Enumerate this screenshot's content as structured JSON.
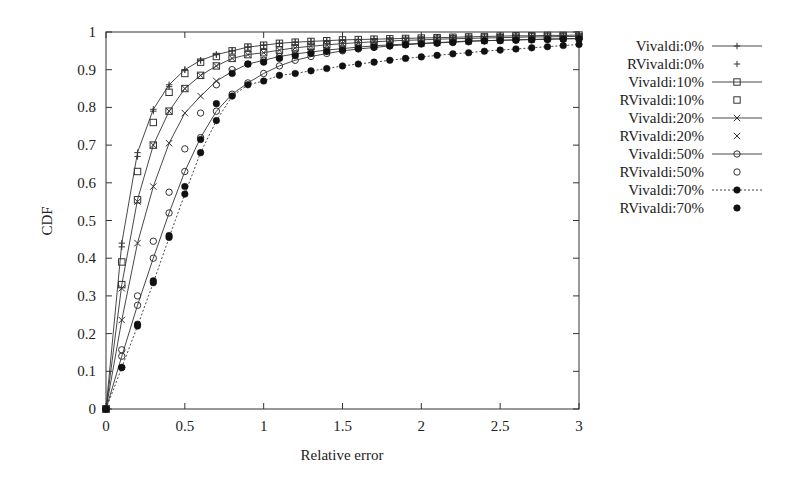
{
  "chart_data": {
    "type": "line",
    "title": "",
    "xlabel": "Relative error",
    "ylabel": "CDF",
    "xlim": [
      0,
      3
    ],
    "ylim": [
      0,
      1
    ],
    "xticks": [
      "0",
      "0.5",
      "1",
      "1.5",
      "2",
      "2.5",
      "3"
    ],
    "xtick_values": [
      0,
      0.5,
      1,
      1.5,
      2,
      2.5,
      3
    ],
    "yticks": [
      "0",
      "0.1",
      "0.2",
      "0.3",
      "0.4",
      "0.5",
      "0.6",
      "0.7",
      "0.8",
      "0.9",
      "1"
    ],
    "ytick_values": [
      0,
      0.1,
      0.2,
      0.3,
      0.4,
      0.5,
      0.6,
      0.7,
      0.8,
      0.9,
      1
    ],
    "grid": false,
    "legend_position": "outside-right",
    "x": [
      0,
      0.1,
      0.2,
      0.3,
      0.4,
      0.5,
      0.6,
      0.7,
      0.8,
      0.9,
      1.0,
      1.1,
      1.2,
      1.3,
      1.4,
      1.5,
      1.6,
      1.7,
      1.8,
      1.9,
      2.0,
      2.1,
      2.2,
      2.3,
      2.4,
      2.5,
      2.6,
      2.7,
      2.8,
      2.9,
      3.0
    ],
    "series": [
      {
        "name": "Vivaldi:0%",
        "marker": "plus",
        "line": "solid",
        "values": [
          0,
          0.44,
          0.68,
          0.795,
          0.86,
          0.9,
          0.925,
          0.94,
          0.95,
          0.96,
          0.965,
          0.97,
          0.973,
          0.975,
          0.977,
          0.979,
          0.98,
          0.981,
          0.982,
          0.983,
          0.984,
          0.985,
          0.986,
          0.987,
          0.988,
          0.989,
          0.99,
          0.99,
          0.991,
          0.991,
          0.992
        ]
      },
      {
        "name": "RVivaldi:0%",
        "marker": "plus",
        "line": "none",
        "values": [
          0,
          0.43,
          0.67,
          0.79,
          0.855,
          0.9,
          0.925,
          0.94,
          0.95,
          0.96,
          0.965,
          0.97,
          0.973,
          0.975,
          0.977,
          0.979,
          0.98,
          0.981,
          0.982,
          0.983,
          0.984,
          0.985,
          0.986,
          0.987,
          0.988,
          0.989,
          0.99,
          0.99,
          0.991,
          0.991,
          0.992
        ]
      },
      {
        "name": "Vivaldi:10%",
        "marker": "square",
        "line": "solid",
        "values": [
          0,
          0.33,
          0.555,
          0.7,
          0.79,
          0.85,
          0.885,
          0.91,
          0.93,
          0.94,
          0.945,
          0.952,
          0.958,
          0.962,
          0.966,
          0.969,
          0.972,
          0.974,
          0.976,
          0.978,
          0.979,
          0.981,
          0.982,
          0.983,
          0.984,
          0.985,
          0.986,
          0.987,
          0.987,
          0.988,
          0.988
        ]
      },
      {
        "name": "RVivaldi:10%",
        "marker": "square",
        "line": "none",
        "values": [
          0,
          0.39,
          0.63,
          0.76,
          0.84,
          0.89,
          0.92,
          0.935,
          0.95,
          0.96,
          0.965,
          0.97,
          0.973,
          0.975,
          0.977,
          0.979,
          0.98,
          0.981,
          0.982,
          0.983,
          0.984,
          0.985,
          0.986,
          0.987,
          0.988,
          0.989,
          0.99,
          0.99,
          0.991,
          0.991,
          0.992
        ]
      },
      {
        "name": "Vivaldi:20%",
        "marker": "x",
        "line": "solid",
        "values": [
          0,
          0.236,
          0.44,
          0.59,
          0.705,
          0.785,
          0.83,
          0.87,
          0.895,
          0.915,
          0.925,
          0.935,
          0.942,
          0.947,
          0.952,
          0.956,
          0.96,
          0.963,
          0.966,
          0.968,
          0.97,
          0.972,
          0.974,
          0.976,
          0.977,
          0.978,
          0.979,
          0.98,
          0.981,
          0.982,
          0.982
        ]
      },
      {
        "name": "RVivaldi:20%",
        "marker": "x",
        "line": "none",
        "values": [
          0,
          0.32,
          0.55,
          0.7,
          0.79,
          0.85,
          0.885,
          0.91,
          0.93,
          0.94,
          0.945,
          0.952,
          0.958,
          0.962,
          0.966,
          0.969,
          0.972,
          0.974,
          0.976,
          0.978,
          0.979,
          0.981,
          0.982,
          0.983,
          0.984,
          0.985,
          0.986,
          0.987,
          0.987,
          0.988,
          0.988
        ]
      },
      {
        "name": "Vivaldi:50%",
        "marker": "circle",
        "line": "solid",
        "values": [
          0,
          0.14,
          0.275,
          0.4,
          0.52,
          0.63,
          0.72,
          0.79,
          0.835,
          0.865,
          0.89,
          0.91,
          0.925,
          0.935,
          0.943,
          0.95,
          0.955,
          0.959,
          0.963,
          0.966,
          0.969,
          0.971,
          0.973,
          0.975,
          0.977,
          0.978,
          0.979,
          0.98,
          0.981,
          0.982,
          0.983
        ]
      },
      {
        "name": "RVivaldi:50%",
        "marker": "circle",
        "line": "none",
        "values": [
          0,
          0.157,
          0.3,
          0.445,
          0.575,
          0.69,
          0.785,
          0.86,
          0.9,
          0.915,
          0.925,
          0.935,
          0.942,
          0.947,
          0.952,
          0.956,
          0.96,
          0.963,
          0.966,
          0.968,
          0.97,
          0.972,
          0.974,
          0.976,
          0.977,
          0.978,
          0.979,
          0.98,
          0.981,
          0.982,
          0.982
        ]
      },
      {
        "name": "Vivaldi:70%",
        "marker": "filled-circle",
        "line": "dashed",
        "values": [
          0,
          0.11,
          0.22,
          0.335,
          0.455,
          0.57,
          0.68,
          0.765,
          0.83,
          0.86,
          0.87,
          0.885,
          0.89,
          0.897,
          0.903,
          0.91,
          0.915,
          0.92,
          0.925,
          0.93,
          0.934,
          0.938,
          0.942,
          0.945,
          0.949,
          0.952,
          0.955,
          0.958,
          0.961,
          0.964,
          0.967
        ]
      },
      {
        "name": "RVivaldi:70%",
        "marker": "filled-circle",
        "line": "none",
        "values": [
          0,
          0.11,
          0.225,
          0.34,
          0.46,
          0.59,
          0.715,
          0.81,
          0.89,
          0.915,
          0.92,
          0.93,
          0.937,
          0.943,
          0.948,
          0.952,
          0.956,
          0.96,
          0.963,
          0.966,
          0.968,
          0.97,
          0.972,
          0.974,
          0.976,
          0.977,
          0.978,
          0.979,
          0.98,
          0.981,
          0.982
        ]
      }
    ]
  }
}
